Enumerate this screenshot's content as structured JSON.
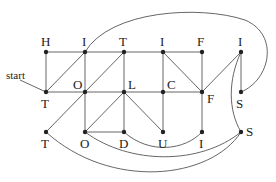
{
  "diagram": {
    "start_label": "start",
    "nodes": [
      {
        "id": "n1",
        "label": "H",
        "x": 46,
        "y": 52,
        "lx": 41,
        "ly": 46
      },
      {
        "id": "n2",
        "label": "I",
        "x": 85,
        "y": 52,
        "lx": 82,
        "ly": 46
      },
      {
        "id": "n3",
        "label": "T",
        "x": 124,
        "y": 52,
        "lx": 119,
        "ly": 46
      },
      {
        "id": "n4",
        "label": "I",
        "x": 163,
        "y": 52,
        "lx": 160,
        "ly": 46
      },
      {
        "id": "n5",
        "label": "F",
        "x": 202,
        "y": 52,
        "lx": 197,
        "ly": 46
      },
      {
        "id": "n6",
        "label": "I",
        "x": 241,
        "y": 52,
        "lx": 238,
        "ly": 46
      },
      {
        "id": "n7",
        "label": "T",
        "x": 46,
        "y": 92,
        "lx": 41,
        "ly": 108
      },
      {
        "id": "n8",
        "label": "O",
        "x": 85,
        "y": 92,
        "lx": 73,
        "ly": 89
      },
      {
        "id": "n9",
        "label": "L",
        "x": 124,
        "y": 92,
        "lx": 128,
        "ly": 89
      },
      {
        "id": "n10",
        "label": "C",
        "x": 163,
        "y": 92,
        "lx": 167,
        "ly": 89
      },
      {
        "id": "n11",
        "label": "F",
        "x": 202,
        "y": 92,
        "lx": 207,
        "ly": 103
      },
      {
        "id": "n12",
        "label": "S",
        "x": 241,
        "y": 92,
        "lx": 236,
        "ly": 108
      },
      {
        "id": "n13",
        "label": "T",
        "x": 46,
        "y": 132,
        "lx": 41,
        "ly": 148
      },
      {
        "id": "n14",
        "label": "O",
        "x": 85,
        "y": 132,
        "lx": 80,
        "ly": 148
      },
      {
        "id": "n15",
        "label": "D",
        "x": 124,
        "y": 132,
        "lx": 119,
        "ly": 148
      },
      {
        "id": "n16",
        "label": "U",
        "x": 163,
        "y": 132,
        "lx": 158,
        "ly": 148
      },
      {
        "id": "n17",
        "label": "I",
        "x": 202,
        "y": 132,
        "lx": 199,
        "ly": 148
      },
      {
        "id": "n18",
        "label": "S",
        "x": 241,
        "y": 132,
        "lx": 246,
        "ly": 136
      }
    ],
    "edges": [
      {
        "from": "n1",
        "to": "n2",
        "type": "line"
      },
      {
        "from": "n2",
        "to": "n3",
        "type": "line"
      },
      {
        "from": "n3",
        "to": "n4",
        "type": "line"
      },
      {
        "from": "n4",
        "to": "n5",
        "type": "line"
      },
      {
        "from": "n1",
        "to": "n7",
        "type": "line"
      },
      {
        "from": "n2",
        "to": "n7",
        "type": "line"
      },
      {
        "from": "n2",
        "to": "n8",
        "type": "line"
      },
      {
        "from": "n3",
        "to": "n8",
        "type": "line"
      },
      {
        "from": "n3",
        "to": "n9",
        "type": "line"
      },
      {
        "from": "n4",
        "to": "n10",
        "type": "line"
      },
      {
        "from": "n4",
        "to": "n11",
        "type": "line"
      },
      {
        "from": "n5",
        "to": "n11",
        "type": "line"
      },
      {
        "from": "n6",
        "to": "n11",
        "type": "line"
      },
      {
        "from": "n6",
        "to": "n12",
        "type": "line"
      },
      {
        "from": "n7",
        "to": "n8",
        "type": "line"
      },
      {
        "from": "n8",
        "to": "n9",
        "type": "line"
      },
      {
        "from": "n9",
        "to": "n10",
        "type": "line"
      },
      {
        "from": "n10",
        "to": "n11",
        "type": "line"
      },
      {
        "from": "n8",
        "to": "n13",
        "type": "line"
      },
      {
        "from": "n8",
        "to": "n14",
        "type": "line"
      },
      {
        "from": "n9",
        "to": "n14",
        "type": "line"
      },
      {
        "from": "n9",
        "to": "n15",
        "type": "line"
      },
      {
        "from": "n9",
        "to": "n16",
        "type": "line"
      },
      {
        "from": "n10",
        "to": "n16",
        "type": "line"
      },
      {
        "from": "n11",
        "to": "n17",
        "type": "line"
      },
      {
        "from": "n14",
        "to": "n15",
        "type": "line"
      },
      {
        "from": "n2",
        "to": "n12",
        "type": "curve",
        "path": "M85,52 C110,10 200,5 245,20 C280,35 270,80 241,92"
      },
      {
        "from": "n6",
        "to": "n18",
        "type": "curve",
        "path": "M241,52 C228,80 228,110 241,132"
      },
      {
        "from": "n15",
        "to": "n17",
        "type": "curve",
        "path": "M124,132 C150,155 185,150 202,132"
      },
      {
        "from": "n14",
        "to": "n18",
        "type": "curve",
        "path": "M85,132 C130,165 200,165 241,132"
      },
      {
        "from": "n13",
        "to": "n18",
        "type": "curve",
        "path": "M46,132 C110,190 210,180 241,132"
      }
    ],
    "start_pointer": {
      "x1": 20,
      "y1": 80,
      "x2": 46,
      "y2": 92
    }
  }
}
